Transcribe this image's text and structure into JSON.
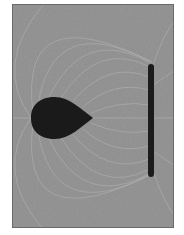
{
  "image": {
    "description": "Field-line pattern between a teardrop-shaped conductor and a flat plate electrode",
    "background_color": "#8f8f8f",
    "line_color": "#c8c8c8",
    "conductor_color": "#1a1a1a",
    "objects": [
      {
        "name": "teardrop-conductor",
        "shape": "teardrop",
        "tip_direction": "right"
      },
      {
        "name": "plate-electrode",
        "shape": "vertical bar"
      }
    ]
  }
}
